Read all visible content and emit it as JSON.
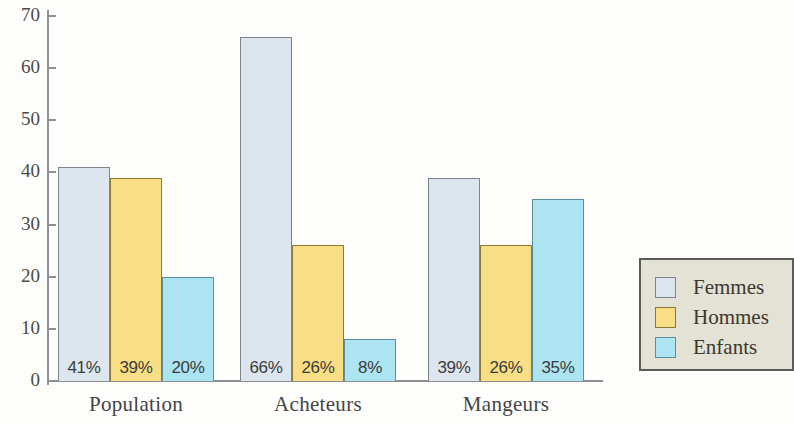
{
  "chart_data": {
    "type": "bar",
    "title": "",
    "xlabel": "",
    "ylabel": "",
    "ylim": [
      0,
      70
    ],
    "yticks": [
      0,
      10,
      20,
      30,
      40,
      50,
      60,
      70
    ],
    "ytick_labels": [
      "0",
      "10",
      "20",
      "30",
      "40",
      "50",
      "60",
      "70"
    ],
    "grid": false,
    "legend_position": "right",
    "categories": [
      "Population",
      "Acheteurs",
      "Mangeurs"
    ],
    "series": [
      {
        "name": "Femmes",
        "color": "#dde5ef",
        "values": [
          41,
          66,
          39
        ],
        "labels": [
          "41%",
          "39%",
          "39%"
        ]
      },
      {
        "name": "Hommes",
        "color": "#f8de84",
        "values": [
          39,
          26,
          26
        ],
        "labels": [
          "39%",
          "26%",
          "26%"
        ]
      },
      {
        "name": "Enfants",
        "color": "#ade4f1",
        "values": [
          20,
          8,
          35
        ],
        "labels": [
          "20%",
          "8%",
          "35%"
        ]
      }
    ],
    "groups": [
      {
        "category": "Population",
        "bars": [
          {
            "series": "Femmes",
            "value": 41,
            "label": "41%"
          },
          {
            "series": "Hommes",
            "value": 39,
            "label": "39%"
          },
          {
            "series": "Enfants",
            "value": 20,
            "label": "20%"
          }
        ]
      },
      {
        "category": "Acheteurs",
        "bars": [
          {
            "series": "Femmes",
            "value": 66,
            "label": "66%"
          },
          {
            "series": "Hommes",
            "value": 26,
            "label": "26%"
          },
          {
            "series": "Enfants",
            "value": 8,
            "label": "8%"
          }
        ]
      },
      {
        "category": "Mangeurs",
        "bars": [
          {
            "series": "Femmes",
            "value": 39,
            "label": "39%"
          },
          {
            "series": "Hommes",
            "value": 26,
            "label": "26%"
          },
          {
            "series": "Enfants",
            "value": 35,
            "label": "35%"
          }
        ]
      }
    ]
  },
  "axis": {
    "y_labels": [
      "70",
      "60",
      "50",
      "40",
      "30",
      "20",
      "10",
      "0"
    ]
  },
  "legend": {
    "items": [
      {
        "label": "Femmes",
        "color": "#dde5ef"
      },
      {
        "label": "Hommes",
        "color": "#f8de84"
      },
      {
        "label": "Enfants",
        "color": "#ade4f1"
      }
    ]
  },
  "colors": {
    "femmes": "#dde5ef",
    "hommes": "#f8de84",
    "enfants": "#ade4f1",
    "axis": "#8e8f93",
    "legend_background": "#e4e2d4",
    "legend_border": "#5b5b57",
    "text": "#444446"
  }
}
